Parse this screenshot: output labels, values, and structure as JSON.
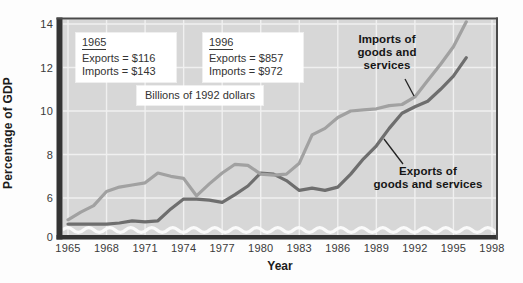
{
  "figure": {
    "y_axis_title": "Percentage of GDP",
    "x_axis_title": "Year",
    "unit_note": "Billions of 1992 dollars",
    "box_1965": {
      "title": "1965",
      "exports_line": "Exports = $116",
      "imports_line": "Imports = $143"
    },
    "box_1996": {
      "title": "1996",
      "exports_line": "Exports = $857",
      "imports_line": "Imports = $972"
    },
    "imports_label_lines": [
      "Imports of",
      "goods and",
      "services"
    ],
    "exports_label_lines": [
      "Exports of",
      "goods and services"
    ]
  },
  "chart_data": {
    "type": "line",
    "xlabel": "Year",
    "ylabel": "Percentage of GDP",
    "x_tick_labels": [
      "1965",
      "1968",
      "1971",
      "1974",
      "1977",
      "1980",
      "1983",
      "1986",
      "1989",
      "1992",
      "1995",
      "1998"
    ],
    "y_tick_labels": [
      "14",
      "12",
      "10",
      "8",
      "6",
      "0"
    ],
    "y_axis_break": true,
    "grid": true,
    "xlim": [
      1964.6,
      1998.3
    ],
    "ylim": [
      0,
      14.3
    ],
    "colors": {
      "plot_bg": "#d7d7d7",
      "gridline": "#f0f0f0",
      "axis": "#333333",
      "imports_line": "#a1a1a1",
      "exports_line": "#6e6e6e",
      "box_bg": "#ffffff",
      "break_squiggle": "#fafafa"
    },
    "years": [
      1965,
      1966,
      1967,
      1968,
      1969,
      1970,
      1971,
      1972,
      1973,
      1974,
      1975,
      1976,
      1977,
      1978,
      1979,
      1980,
      1981,
      1982,
      1983,
      1984,
      1985,
      1986,
      1987,
      1988,
      1989,
      1990,
      1991,
      1992,
      1993,
      1994,
      1995,
      1996
    ],
    "series": [
      {
        "name": "Imports of goods and services",
        "color": "#a1a1a1",
        "values": [
          5.0,
          5.35,
          5.65,
          6.3,
          6.5,
          6.6,
          6.7,
          7.15,
          7.0,
          6.9,
          6.1,
          6.65,
          7.15,
          7.55,
          7.5,
          7.1,
          7.05,
          7.1,
          7.6,
          8.9,
          9.2,
          9.7,
          10.0,
          10.05,
          10.1,
          10.25,
          10.3,
          10.65,
          11.4,
          12.15,
          12.95,
          14.1
        ]
      },
      {
        "name": "Exports of goods and services",
        "color": "#6e6e6e",
        "values": [
          4.8,
          4.8,
          4.8,
          4.8,
          4.85,
          4.95,
          4.9,
          4.95,
          5.5,
          5.95,
          5.95,
          5.9,
          5.8,
          6.15,
          6.55,
          7.15,
          7.1,
          6.8,
          6.35,
          6.45,
          6.35,
          6.5,
          7.1,
          7.8,
          8.4,
          9.2,
          9.9,
          10.2,
          10.45,
          11.0,
          11.6,
          12.45
        ]
      }
    ],
    "endpoint_callouts": {
      "y1965": {
        "exports_billions": 116,
        "imports_billions": 143
      },
      "y1996": {
        "exports_billions": 857,
        "imports_billions": 972
      },
      "units": "Billions of 1992 dollars"
    }
  }
}
